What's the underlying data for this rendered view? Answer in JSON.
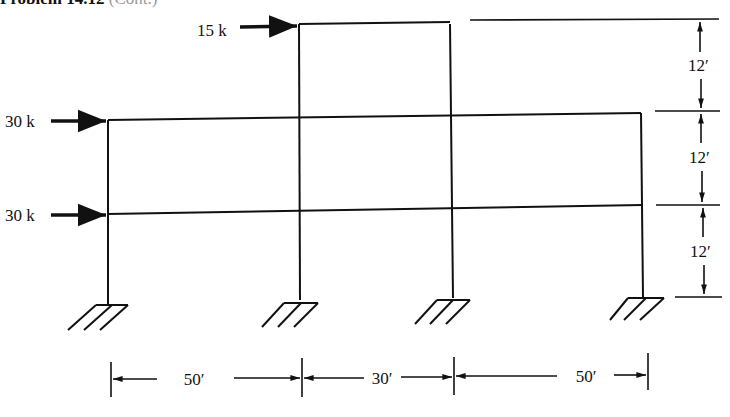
{
  "header": {
    "title": "Problem 14.12",
    "continuation": "(Cont.)"
  },
  "frame": {
    "columns_x_px": [
      108,
      299,
      452,
      643
    ],
    "levels": [
      {
        "name": "roof",
        "span": "middle bay",
        "height_ft": 36
      },
      {
        "name": "second floor",
        "span": "full width",
        "height_ft": 24
      },
      {
        "name": "first floor",
        "span": "full width",
        "height_ft": 12
      }
    ],
    "supports": [
      "fixed",
      "fixed",
      "fixed",
      "fixed"
    ]
  },
  "loads": [
    {
      "label": "15 k",
      "level": "roof",
      "direction": "right"
    },
    {
      "label": "30 k",
      "level": "second floor",
      "direction": "right"
    },
    {
      "label": "30 k",
      "level": "first floor",
      "direction": "right"
    }
  ],
  "dimensions": {
    "vertical": [
      "12′",
      "12′",
      "12′"
    ],
    "horizontal": [
      "50′",
      "30′",
      "50′"
    ]
  }
}
